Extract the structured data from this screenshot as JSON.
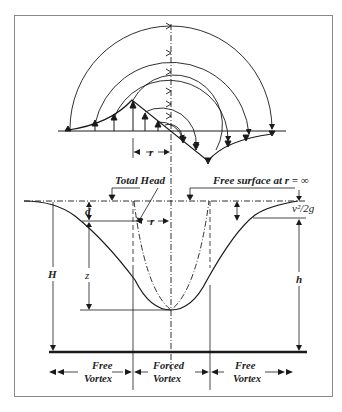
{
  "figure": {
    "colors": {
      "ink": "#1a1a1a",
      "frame": "#888888",
      "background": "#ffffff"
    }
  },
  "labels": {
    "radius_top": "r",
    "total_head": "Total Head",
    "free_surface": "Free surface at r = ∞",
    "velocity_head": "v²/2g",
    "depth_d": "d",
    "radius_mid": "r",
    "height_z": "z",
    "height_H": "H",
    "height_h": "h",
    "zone_left_line1": "Free",
    "zone_left_line2": "Vortex",
    "zone_center_line1": "Forced",
    "zone_center_line2": "Vortex",
    "zone_right_line1": "Free",
    "zone_right_line2": "Vortex"
  }
}
